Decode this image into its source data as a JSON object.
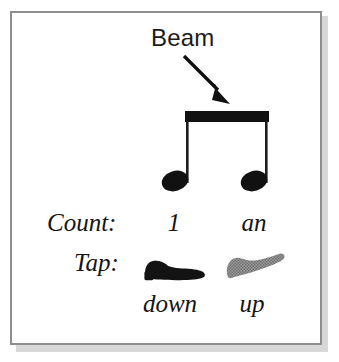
{
  "figure": {
    "annotation": {
      "label": "Beam",
      "arrow": "arrow-down-right-icon"
    },
    "notation": {
      "description": "two-beamed-eighth-notes",
      "note_count": 2,
      "beam_color": "#111111",
      "note_color": "#111111"
    },
    "rows": [
      {
        "label": "Count:",
        "values": [
          "1",
          "an"
        ]
      },
      {
        "label": "Tap:",
        "icons": [
          "shoe-down-icon",
          "shoe-up-icon"
        ],
        "captions": [
          "down",
          "up"
        ]
      }
    ],
    "count_label": "Count:",
    "count_beat_1": "1",
    "count_beat_2": "an",
    "tap_label": "Tap:",
    "tap_caption_1": "down",
    "tap_caption_2": "up",
    "colors": {
      "ink": "#141414",
      "shoe_down": "#131313",
      "shoe_up": "#8d8d8d",
      "frame": "#8e8e8e",
      "frame_shadow": "#d8d8d8",
      "background": "#ffffff"
    }
  }
}
